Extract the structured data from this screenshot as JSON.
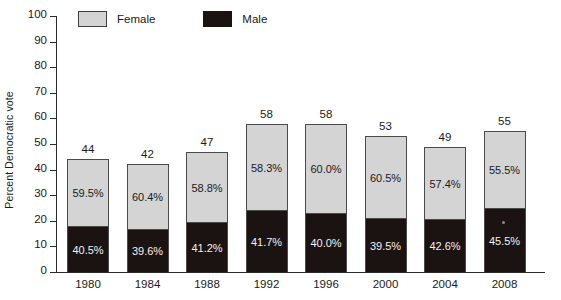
{
  "chart_data": {
    "type": "bar",
    "subtype": "stacked-100-percent-composition",
    "title": "",
    "xlabel": "",
    "ylabel": "Percent Democratic vote",
    "ylim": [
      0,
      100
    ],
    "ytick_step": 10,
    "yticks": [
      0,
      10,
      20,
      30,
      40,
      50,
      60,
      70,
      80,
      90,
      100
    ],
    "grid": false,
    "legend_position": "top-left",
    "categories": [
      "1980",
      "1984",
      "1988",
      "1992",
      "1996",
      "2000",
      "2004",
      "2008"
    ],
    "totals": [
      44,
      42,
      47,
      58,
      58,
      53,
      49,
      55
    ],
    "series": [
      {
        "name": "Male",
        "color": "#1b1311",
        "share_labels": [
          "40.5%",
          "39.6%",
          "41.2%",
          "41.7%",
          "40.0%",
          "39.5%",
          "42.6%",
          "45.5%"
        ],
        "shares": [
          40.5,
          39.6,
          41.2,
          41.7,
          40.0,
          39.5,
          42.6,
          45.5
        ],
        "values": [
          17.8,
          16.6,
          19.4,
          24.2,
          23.2,
          20.9,
          20.9,
          25.0
        ]
      },
      {
        "name": "Female",
        "color": "#d4d4d4",
        "share_labels": [
          "59.5%",
          "60.4%",
          "58.8%",
          "58.3%",
          "60.0%",
          "60.5%",
          "57.4%",
          "55.5%"
        ],
        "shares": [
          59.5,
          60.4,
          58.8,
          58.3,
          60.0,
          60.5,
          57.4,
          55.5
        ],
        "values": [
          26.2,
          25.4,
          27.6,
          33.8,
          34.8,
          32.1,
          28.1,
          30.0
        ]
      }
    ]
  },
  "legend": {
    "entries": [
      {
        "label": "Female",
        "swatch": "female-swatch"
      },
      {
        "label": "Male",
        "swatch": "male-swatch"
      }
    ]
  },
  "axes": {
    "y_title": "Percent Democratic vote",
    "y_tick_labels": [
      "100",
      "90",
      "80",
      "70",
      "60",
      "50",
      "40",
      "30",
      "20",
      "10",
      "0"
    ],
    "x_tick_labels": [
      "1980",
      "1984",
      "1988",
      "1992",
      "1996",
      "2000",
      "2004",
      "2008"
    ]
  },
  "bars": [
    {
      "year": "1980",
      "total": "44",
      "female_pct": "59.5%",
      "male_pct": "40.5%"
    },
    {
      "year": "1984",
      "total": "42",
      "female_pct": "60.4%",
      "male_pct": "39.6%"
    },
    {
      "year": "1988",
      "total": "47",
      "female_pct": "58.8%",
      "male_pct": "41.2%"
    },
    {
      "year": "1992",
      "total": "58",
      "female_pct": "58.3%",
      "male_pct": "41.7%"
    },
    {
      "year": "1996",
      "total": "58",
      "female_pct": "60.0%",
      "male_pct": "40.0%"
    },
    {
      "year": "2000",
      "total": "53",
      "female_pct": "60.5%",
      "male_pct": "39.5%"
    },
    {
      "year": "2004",
      "total": "49",
      "female_pct": "57.4%",
      "male_pct": "42.6%"
    },
    {
      "year": "2008",
      "total": "55",
      "female_pct": "55.5%",
      "male_pct": "45.5%"
    }
  ]
}
